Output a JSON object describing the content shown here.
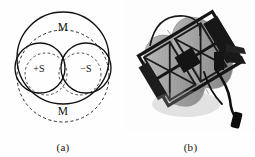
{
  "figure": {
    "background_color": "#fefefe",
    "ink_color": "#111111",
    "panels": [
      {
        "id": "a",
        "caption": "(a)",
        "type": "schematic-diagram",
        "description": "Overlapping circle schematic of a magnetic sensor head",
        "labels": {
          "top": "M",
          "left_inner": "+S",
          "right_inner": "−S",
          "bottom": "M"
        },
        "geometry": {
          "large_solid_circle": {
            "cx": 63,
            "cy": 58,
            "r": 46,
            "stroke": "solid"
          },
          "large_dashed_circle": {
            "cx": 63,
            "cy": 76,
            "r": 46,
            "stroke": "dashed"
          },
          "left_solid_circle": {
            "cx": 40,
            "cy": 68,
            "r": 25,
            "stroke": "solid"
          },
          "right_solid_circle": {
            "cx": 86,
            "cy": 68,
            "r": 25,
            "stroke": "solid"
          },
          "left_dashed_circle": {
            "cx": 46,
            "cy": 74,
            "r": 21,
            "stroke": "dashed"
          },
          "right_dashed_circle": {
            "cx": 80,
            "cy": 74,
            "r": 21,
            "stroke": "dashed"
          }
        }
      },
      {
        "id": "b",
        "caption": "(b)",
        "type": "photograph",
        "description": "Grayscale photograph of the assembled coil sensor head with dark metal frame, mounting brackets and an attached cable with connector",
        "colors": {
          "coil_light": "#b9b9b9",
          "coil_mid": "#9a9a9a",
          "coil_dark": "#7d7d7d",
          "frame_dark": "#161616",
          "cable_dark": "#101010",
          "background": "#fdfdfd"
        }
      }
    ]
  }
}
